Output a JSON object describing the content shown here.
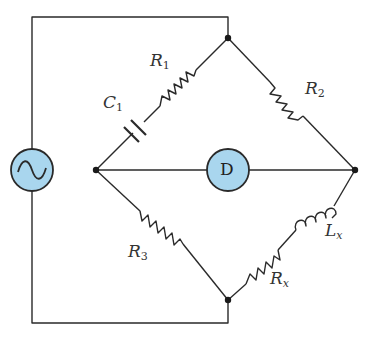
{
  "diagram": {
    "colors": {
      "wire": "#2a2a2a",
      "component_fill": "#a9d6ee",
      "component_stroke": "#2a2a2a",
      "label": "#333333"
    },
    "components": {
      "source": {
        "symbol": "~",
        "type": "ac-source"
      },
      "detector": {
        "symbol": "D",
        "type": "detector"
      },
      "R1": {
        "name": "R",
        "sub": "1"
      },
      "C1": {
        "name": "C",
        "sub": "1"
      },
      "R2": {
        "name": "R",
        "sub": "2"
      },
      "R3": {
        "name": "R",
        "sub": "3"
      },
      "Rx": {
        "name": "R",
        "sub": "x"
      },
      "Lx": {
        "name": "L",
        "sub": "x"
      }
    }
  }
}
